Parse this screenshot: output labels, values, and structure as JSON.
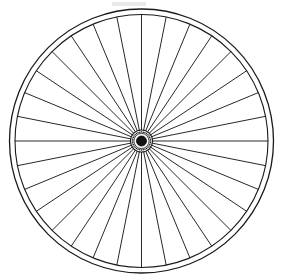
{
  "canvas": {
    "width": 289,
    "height": 279,
    "background_color": "#ffffff"
  },
  "figure": {
    "title": "Bicycle Wheel",
    "style": "black-and-white line drawing",
    "description": "Front view line drawing of a spoked bicycle wheel with a double-line rim, thirty-two straight radial spokes, and a small dark central hub.",
    "line_color": "#1a1a1a",
    "fill_color": "#ffffff"
  },
  "wheel": {
    "center_x": 141.5,
    "center_y": 141.0,
    "tire_outer_radius": 132.0,
    "tire_outer_stroke_width": 1.3,
    "rim_inner_radius": 126.5,
    "rim_inner_stroke_width": 1.1,
    "rim_gap": 5.5
  },
  "spokes": {
    "count": 32,
    "angle_step_degrees": 11.25,
    "start_angle_degrees": -90,
    "inner_radius": 11.0,
    "outer_radius": 126.5,
    "stroke_width": 0.95,
    "color": "#1c1c1c",
    "label": "spoke"
  },
  "hub": {
    "flange_radius": 11.0,
    "ring_radius": 7.6,
    "core_radius": 5.0,
    "core_color": "#141414",
    "nipple_count": 32,
    "nipple_radius": 0.75,
    "label": "hub"
  },
  "artifacts": {
    "scan_smudge": {
      "x": 112,
      "y": 2,
      "width": 34,
      "height": 4,
      "color": "#e9e9e9",
      "label": "faint scan smudge"
    }
  }
}
